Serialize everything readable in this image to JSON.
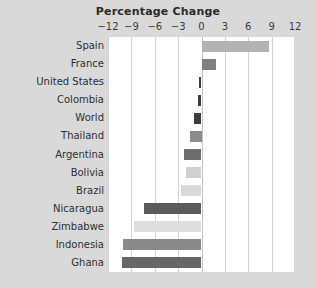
{
  "chart_data": {
    "type": "bar",
    "orientation": "horizontal",
    "title": "Percentage Change",
    "xlabel": "",
    "ylabel": "",
    "xlim": [
      -12,
      12
    ],
    "xticks": [
      -12,
      -9,
      -6,
      -3,
      0,
      3,
      6,
      9,
      12
    ],
    "xticklabels": [
      "−12",
      "−9",
      "−6",
      "−3",
      "0",
      "3",
      "6",
      "9",
      "12"
    ],
    "grid": true,
    "legend": false,
    "categories": [
      "Spain",
      "France",
      "United States",
      "Colombia",
      "World",
      "Thailand",
      "Argentina",
      "Bolivia",
      "Brazil",
      "Nicaragua",
      "Zimbabwe",
      "Indonesia",
      "Ghana"
    ],
    "values": [
      8.6,
      1.9,
      -0.3,
      -0.5,
      -1.0,
      -1.5,
      -2.3,
      -2.0,
      -2.6,
      -7.4,
      -8.6,
      -10.1,
      -10.2
    ],
    "bar_colors": [
      "#b3b3b3",
      "#808080",
      "#3d3d3d",
      "#3d3d3d",
      "#3d3d3d",
      "#8c8c8c",
      "#6e6e6e",
      "#d0d0d0",
      "#d9d9d9",
      "#5a5a5a",
      "#dedede",
      "#8a8a8a",
      "#666666"
    ]
  },
  "figure": {
    "background_color": "#d9d9d9",
    "plot_background_color": "#ffffff",
    "gridline_color": "#d2d2d2",
    "title_color": "#2b2b2b",
    "label_color": "#2f2f2f"
  }
}
